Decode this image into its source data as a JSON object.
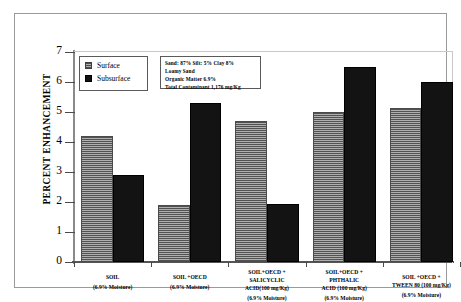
{
  "legend": {
    "position": "top-left-inside",
    "items": [
      {
        "label": "Surface",
        "icon": "square-swatch-hatched",
        "color": "#8d8d8d"
      },
      {
        "label": "Subsurface",
        "icon": "square-swatch-solid",
        "color": "#131313"
      }
    ]
  },
  "infobox": {
    "lines": [
      "Sand: 87%  Silt: 5%   Clay 8%",
      "Loamy Sand",
      "Organic Matter 6.9%",
      "Total  Contaminant  1,176 mg/Kg"
    ]
  },
  "chart_data": {
    "type": "bar",
    "title": "",
    "xlabel": "",
    "ylabel": "PERCENT ENHANCEMENT",
    "ylim": [
      0,
      7
    ],
    "ytick_labels": [
      "0",
      "1",
      "2",
      "3",
      "4",
      "5",
      "6",
      "7"
    ],
    "grid": false,
    "legend_position": "top-left-inside",
    "categories": [
      "SOIL",
      "SOIL +OECD",
      "SOIL+OECD + SALICYCLIC ACID(100 mg/Kg)",
      "SOIL+OECD + PHTHALIC ACID (100 mg/Kg)",
      "SOIL +OECD + TWEEN 80 (100 mg/Kg)"
    ],
    "category_labels": [
      {
        "lines": [
          "SOIL"
        ],
        "sub": "(6.9% Moisture)"
      },
      {
        "lines": [
          "SOIL +OECD"
        ],
        "sub": "(6.9% Moisture)"
      },
      {
        "lines": [
          "SOIL+OECD +",
          "SALICYCLIC",
          "ACID(100 mg/Kg)"
        ],
        "sub": "(6.9% Moisture)"
      },
      {
        "lines": [
          "SOIL+OECD +",
          "PHTHALIC",
          "ACID (100 mg/Kg)"
        ],
        "sub": "(6.9% Moisture)"
      },
      {
        "lines": [
          "SOIL +OECD +",
          "TWEEN 80 (100 mg/Kg)"
        ],
        "sub": "(6.9% Moisture)"
      }
    ],
    "series": [
      {
        "name": "Surface",
        "color": "#8d8d8d",
        "values": [
          4.2,
          1.9,
          4.7,
          5.0,
          5.15
        ]
      },
      {
        "name": "Subsurface",
        "color": "#131313",
        "values": [
          2.9,
          5.3,
          1.95,
          6.5,
          6.0
        ]
      }
    ]
  }
}
